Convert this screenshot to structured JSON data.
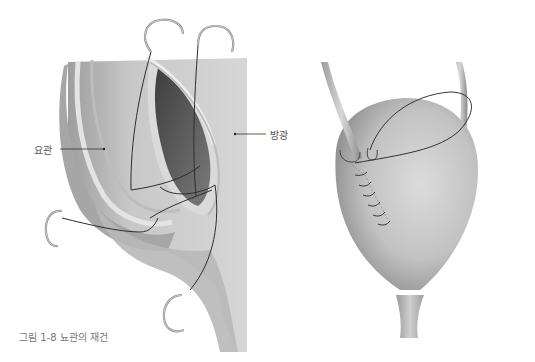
{
  "figure": {
    "caption": "그림 1-8 뇨관의 재건",
    "left_panel": {
      "labels": {
        "ureter": "요관",
        "bladder": "방광"
      }
    },
    "right_panel": {
      "description": "bladder with ureter implanted and sutured incision"
    }
  },
  "colors": {
    "tissue_light": "#d4d4d4",
    "tissue_mid": "#b4b4b4",
    "tissue_dark": "#6a6a6a",
    "suture": "#333333",
    "needle": "#9a9a9a",
    "label_text": "#555555"
  }
}
